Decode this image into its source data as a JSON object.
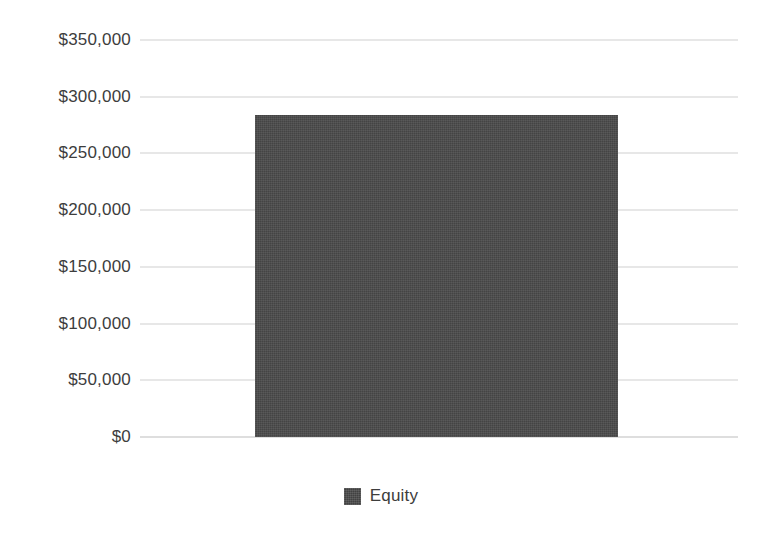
{
  "chart_data": {
    "type": "bar",
    "title": "",
    "subtitle": "",
    "xlabel": "",
    "ylabel": "",
    "categories": [
      "Equity"
    ],
    "values": [
      284000
    ],
    "series": [
      {
        "name": "Equity",
        "values": [
          284000
        ],
        "color": "#4a4a4a"
      }
    ],
    "ylim": [
      0,
      350000
    ],
    "ytick_values": [
      350000,
      300000,
      250000,
      200000,
      150000,
      100000,
      50000,
      0
    ],
    "ytick_labels": [
      "$350,000",
      "$300,000",
      "$250,000",
      "$200,000",
      "$150,000",
      "$100,000",
      "$50,000",
      "$0"
    ],
    "xtick_labels": [],
    "grid": true,
    "grid_color": "#cfcfcf",
    "legend": {
      "position": "bottom-center",
      "entries": [
        {
          "label": "Equity",
          "color": "#4a4a4a"
        }
      ]
    },
    "background_color": "#ffffff",
    "axis_text_color": "#3d3d3d"
  }
}
